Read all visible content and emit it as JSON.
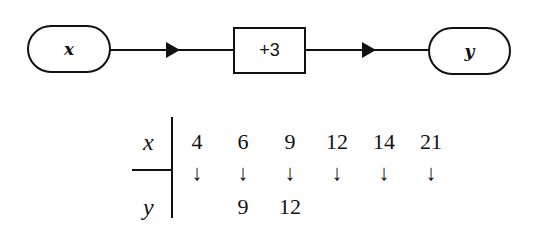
{
  "flow": {
    "input_label": "x",
    "operation_label": "+3",
    "output_label": "y"
  },
  "table": {
    "row_labels": {
      "x": "x",
      "y": "y"
    },
    "arrow_glyph": "↓",
    "columns": [
      {
        "x": "4",
        "y": ""
      },
      {
        "x": "6",
        "y": "9"
      },
      {
        "x": "9",
        "y": "12"
      },
      {
        "x": "12",
        "y": ""
      },
      {
        "x": "14",
        "y": ""
      },
      {
        "x": "21",
        "y": ""
      }
    ]
  }
}
